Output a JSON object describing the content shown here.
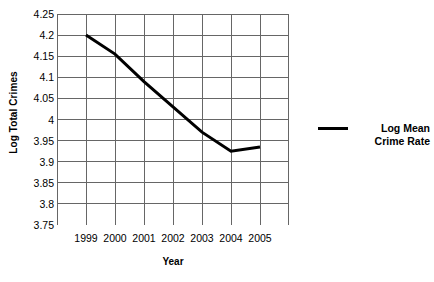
{
  "chart_data": {
    "type": "line",
    "title": "",
    "xlabel": "Year",
    "ylabel": "Log Total Crimes",
    "categories": [
      "1999",
      "2000",
      "2001",
      "2002",
      "2003",
      "2004",
      "2005"
    ],
    "series": [
      {
        "name": "Log Mean Crime Rate",
        "values": [
          4.2,
          4.155,
          4.09,
          4.03,
          3.97,
          3.925,
          3.935
        ],
        "color": "#000000"
      }
    ],
    "ylim": [
      3.75,
      4.25
    ],
    "ytick_labels": [
      "4.25",
      "4.2",
      "4.15",
      "4.1",
      "4.05",
      "4",
      "3.95",
      "3.9",
      "3.85",
      "3.8",
      "3.75"
    ],
    "ytick_values": [
      4.25,
      4.2,
      4.15,
      4.1,
      4.05,
      4.0,
      3.95,
      3.9,
      3.85,
      3.8,
      3.75
    ],
    "xtick_labels": [
      "1999",
      "2000",
      "2001",
      "2002",
      "2003",
      "2004",
      "2005"
    ],
    "grid": {
      "horizontal": true,
      "vertical": true,
      "color": "#666666"
    },
    "legend": {
      "position": "right",
      "entries": [
        {
          "label_line1": "Log Mean",
          "label_line2": "Crime Rate",
          "marker": "line-swatch",
          "color": "#000000"
        }
      ]
    }
  }
}
